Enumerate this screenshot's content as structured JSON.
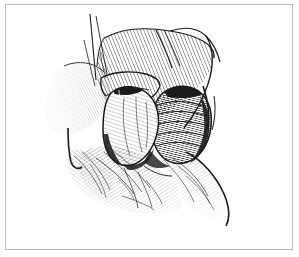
{
  "figure": {
    "domain": "Natural-Image",
    "kind": "line-art-illustration",
    "medium": "pen-and-ink hatched medical illustration",
    "caption": "",
    "alt_text": "Black and white pen-and-ink surgical illustration showing two elongated oval structures exposed within a hatched tissue field, held open by thin retractor lines.",
    "background_color": "#ffffff",
    "ink_color": "#1a1a1a",
    "frame": {
      "name": "figure-border",
      "color": "#bdbdbd",
      "width_px": 1,
      "inset_left_px": 5,
      "inset_top_px": 4,
      "box_width_px": 288,
      "box_height_px": 246
    },
    "elements": [
      {
        "name": "upper-tissue-flap",
        "label": "Upper hatched tissue flap",
        "description": "Broad diagonal band of dense parallel hatching sweeping from upper-left to upper-right, forming the retracted tissue plane above the exposed structures."
      },
      {
        "name": "left-tubular-structure",
        "label": "Left tubular structure",
        "description": "Lighter elongated oval with fine longitudinal hatching and a dark crescent shadow along its lower-left contour; a dark notch marks its superior pole."
      },
      {
        "name": "right-tubular-structure",
        "label": "Right tubular structure",
        "description": "Darker elongated cylinder rendered with dense transverse ribbed hatching, giving a banded corrugated appearance."
      },
      {
        "name": "left-retractor-hook",
        "label": "Left retractor hook",
        "description": "Slender V-shaped instrument line hooking the tissue margin on the left side of the field."
      },
      {
        "name": "right-retractor-hook",
        "label": "Right retractor hook",
        "description": "Pair of curved instrument lines entering from the upper right and holding the tissue edge aside."
      },
      {
        "name": "suture-strands",
        "label": "Suture strands",
        "description": "Thin crossing filament lines descending from the top of the field."
      },
      {
        "name": "lower-tissue-fan",
        "label": "Lower tissue fan",
        "description": "Radiating feathered hatch lines fanning downward and fading to white at the bottom of the field."
      },
      {
        "name": "right-flank-contour",
        "label": "Right flank contour",
        "description": "Strong curved outline descending to the lower right with trailing feathered hatching."
      }
    ]
  }
}
